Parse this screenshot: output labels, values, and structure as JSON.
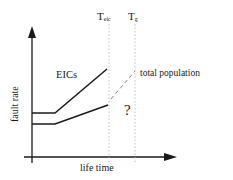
{
  "diagram": {
    "y_axis_label": "fault rate",
    "x_axis_label": "life time",
    "markers": [
      {
        "id": "t-eic",
        "main": "T",
        "sub": "eic"
      },
      {
        "id": "t-g",
        "main": "T",
        "sub": "g"
      }
    ],
    "curves": [
      {
        "id": "eics",
        "label": "EICs",
        "style": "solid"
      },
      {
        "id": "total-population",
        "label": "total population",
        "style": "solid-then-dashed"
      }
    ],
    "uncertainty_mark": "?",
    "colors": {
      "line": "#1a1a1a",
      "guide": "#b0b0b0",
      "dashed": "#888888"
    }
  }
}
